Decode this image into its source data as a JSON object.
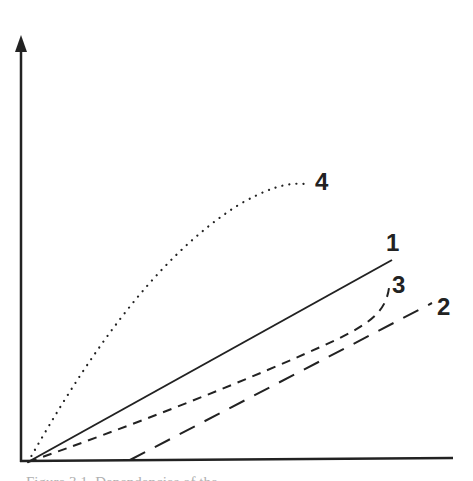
{
  "figure": {
    "type": "schematic-line-diagram",
    "axes": {
      "y_axis": {
        "has_arrow": true,
        "label": ""
      },
      "x_axis": {
        "has_arrow": false,
        "label": ""
      }
    },
    "curves": [
      {
        "id": "1",
        "label": "1",
        "style": "solid",
        "shape": "linear from origin"
      },
      {
        "id": "2",
        "label": "2",
        "style": "long-dashed",
        "shape": "linear, starts offset on x-axis"
      },
      {
        "id": "3",
        "label": "3",
        "style": "short-dashed",
        "shape": "from origin, slightly convex, rising sharply at end"
      },
      {
        "id": "4",
        "label": "4",
        "style": "dotted",
        "shape": "from origin, concave, saturating"
      }
    ],
    "caption": "Figure 3.1. Dependencies of the ..."
  },
  "colors": {
    "line": "#222222",
    "caption": "#b0b0b0",
    "background": "#ffffff"
  }
}
